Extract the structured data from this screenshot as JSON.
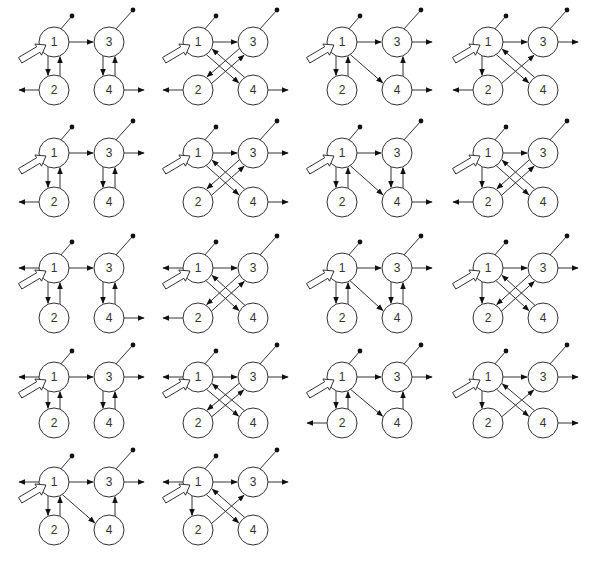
{
  "figure": {
    "node_labels": [
      "1",
      "2",
      "3",
      "4"
    ],
    "colors": {
      "stroke": "#333333",
      "fill": "#ffffff",
      "dot": "#111111"
    }
  },
  "layout": {
    "col_x": [
      54,
      198,
      342,
      488
    ],
    "rows": [
      {
        "y_top": 42,
        "y_bottom": 90
      },
      {
        "y_top": 153,
        "y_bottom": 202
      },
      {
        "y_top": 268,
        "y_bottom": 318
      },
      {
        "y_top": 377,
        "y_bottom": 423
      },
      {
        "y_top": 482,
        "y_bottom": 530
      }
    ],
    "dx": 55,
    "radius": 15
  },
  "diagrams": [
    {
      "id": 1,
      "row": 0,
      "col": 0,
      "edges": [
        "13",
        "12",
        "21",
        "34",
        "43"
      ],
      "outputs": [
        "2L",
        "4R"
      ]
    },
    {
      "id": 2,
      "row": 0,
      "col": 1,
      "edges": [
        "13",
        "14",
        "41",
        "23",
        "32"
      ],
      "outputs": [
        "2L",
        "4R"
      ]
    },
    {
      "id": 3,
      "row": 0,
      "col": 2,
      "edges": [
        "13",
        "12",
        "21",
        "14",
        "43"
      ],
      "outputs": [
        "3R",
        "4R"
      ]
    },
    {
      "id": 4,
      "row": 0,
      "col": 3,
      "edges": [
        "13",
        "12",
        "14",
        "41",
        "23"
      ],
      "outputs": [
        "2L",
        "3R"
      ]
    },
    {
      "id": 5,
      "row": 1,
      "col": 0,
      "edges": [
        "13",
        "12",
        "21",
        "34",
        "43"
      ],
      "outputs": [
        "2L",
        "3R"
      ]
    },
    {
      "id": 6,
      "row": 1,
      "col": 1,
      "edges": [
        "13",
        "14",
        "41",
        "23",
        "32"
      ],
      "outputs": [
        "3R",
        "4R"
      ]
    },
    {
      "id": 7,
      "row": 1,
      "col": 2,
      "edges": [
        "13",
        "12",
        "21",
        "14",
        "34",
        "43"
      ],
      "outputs": [
        "4R"
      ]
    },
    {
      "id": 8,
      "row": 1,
      "col": 3,
      "edges": [
        "13",
        "12",
        "14",
        "41",
        "23",
        "32"
      ],
      "outputs": [
        "2L"
      ]
    },
    {
      "id": 9,
      "row": 2,
      "col": 0,
      "edges": [
        "13",
        "12",
        "21",
        "34",
        "43"
      ],
      "outputs": [
        "1L",
        "4R"
      ]
    },
    {
      "id": 10,
      "row": 2,
      "col": 1,
      "edges": [
        "13",
        "14",
        "41",
        "23",
        "32"
      ],
      "outputs": [
        "1L",
        "2L"
      ]
    },
    {
      "id": 11,
      "row": 2,
      "col": 2,
      "edges": [
        "13",
        "12",
        "21",
        "14",
        "34",
        "43"
      ],
      "outputs": [
        "3R"
      ]
    },
    {
      "id": 12,
      "row": 2,
      "col": 3,
      "edges": [
        "13",
        "12",
        "14",
        "41",
        "23",
        "32"
      ],
      "outputs": [
        "3R"
      ]
    },
    {
      "id": 13,
      "row": 3,
      "col": 0,
      "edges": [
        "13",
        "12",
        "21",
        "34",
        "43"
      ],
      "outputs": [
        "1L",
        "3R"
      ]
    },
    {
      "id": 14,
      "row": 3,
      "col": 1,
      "edges": [
        "13",
        "14",
        "41",
        "23",
        "32"
      ],
      "outputs": [
        "1L",
        "3R"
      ]
    },
    {
      "id": 15,
      "row": 3,
      "col": 2,
      "edges": [
        "13",
        "12",
        "21",
        "14",
        "43"
      ],
      "outputs": [
        "2L",
        "3R"
      ]
    },
    {
      "id": 16,
      "row": 3,
      "col": 3,
      "edges": [
        "13",
        "12",
        "14",
        "41",
        "23"
      ],
      "outputs": [
        "3R",
        "4R"
      ]
    },
    {
      "id": 17,
      "row": 4,
      "col": 0,
      "edges": [
        "13",
        "12",
        "21",
        "14",
        "43"
      ],
      "outputs": [
        "1L",
        "3R"
      ]
    },
    {
      "id": 18,
      "row": 4,
      "col": 1,
      "edges": [
        "13",
        "12",
        "14",
        "41",
        "23"
      ],
      "outputs": [
        "1L",
        "3R"
      ]
    }
  ]
}
